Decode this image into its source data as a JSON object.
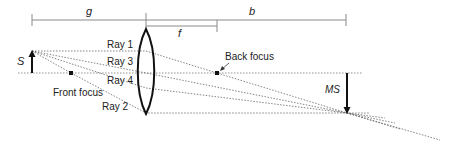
{
  "diagram": {
    "type": "thin-lens-ray-diagram",
    "dimensions": {
      "object_distance": "g",
      "image_distance": "b",
      "focal_length": "f"
    },
    "labels": {
      "object_size": "S",
      "image_size": "MS",
      "front_focus": "Front focus",
      "back_focus": "Back focus"
    },
    "rays": [
      {
        "id": "ray1",
        "label": "Ray 1"
      },
      {
        "id": "ray3",
        "label": "Ray 3"
      },
      {
        "id": "ray4",
        "label": "Ray 4"
      },
      {
        "id": "ray2",
        "label": "Ray 2"
      }
    ],
    "colors": {
      "line": "#222222",
      "dimension": "#888888",
      "ray": "#666666"
    }
  }
}
